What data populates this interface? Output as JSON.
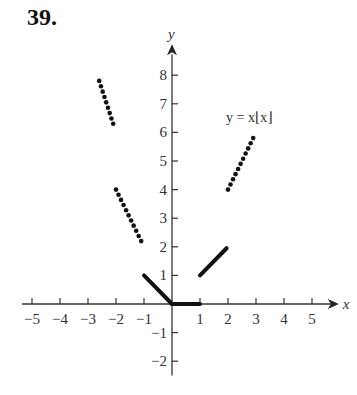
{
  "problem_number": "39.",
  "chart_data": {
    "type": "scatter",
    "title": "",
    "function_label": "y = x⌊x⌋",
    "xlabel": "x",
    "ylabel": "y",
    "xlim": [
      -5.5,
      5.6
    ],
    "ylim": [
      -2.5,
      8.8
    ],
    "grid": false,
    "x_ticks": [
      -5,
      -4,
      -3,
      -2,
      -1,
      1,
      2,
      3,
      4,
      5
    ],
    "x_tick_labels": [
      "−5",
      "−4",
      "−3",
      "−2",
      "−1",
      "1",
      "2",
      "3",
      "4",
      "5"
    ],
    "y_ticks": [
      -2,
      -1,
      1,
      2,
      3,
      4,
      5,
      6,
      7,
      8
    ],
    "y_tick_labels": [
      "−2",
      "−1",
      "1",
      "2",
      "3",
      "4",
      "5",
      "6",
      "7",
      "8"
    ],
    "series": [
      {
        "name": "segment [-3,-2.5]",
        "style": "dotted",
        "x_start": -2.6,
        "x_end": -2.1,
        "y_start": 7.8,
        "y_end": 6.3
      },
      {
        "name": "segment [-2,-1)",
        "style": "dotted",
        "x_start": -2.0,
        "x_end": -1.1,
        "y_start": 4.0,
        "y_end": 2.2
      },
      {
        "name": "segment [-1,0)",
        "style": "solid",
        "x_start": -1.0,
        "x_end": 0.0,
        "y_start": 1.0,
        "y_end": 0.0
      },
      {
        "name": "segment [0,1)",
        "style": "solid",
        "x_start": 0.0,
        "x_end": 1.0,
        "y_start": 0.0,
        "y_end": 0.0
      },
      {
        "name": "segment [1,2)",
        "style": "solid",
        "x_start": 1.0,
        "x_end": 1.95,
        "y_start": 1.0,
        "y_end": 1.95
      },
      {
        "name": "segment [2,3)",
        "style": "dotted",
        "x_start": 2.0,
        "x_end": 2.9,
        "y_start": 4.0,
        "y_end": 5.8
      }
    ]
  }
}
